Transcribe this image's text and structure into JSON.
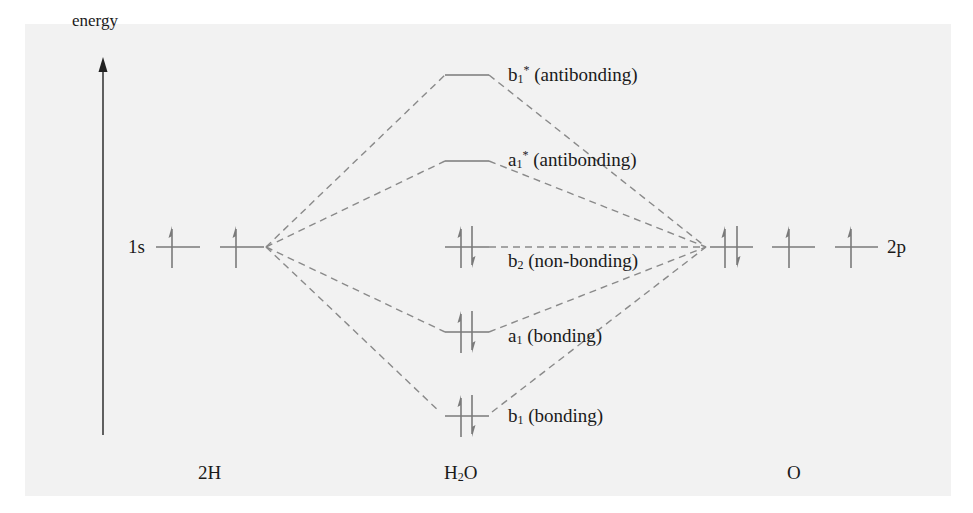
{
  "diagram": {
    "type": "molecular-orbital-diagram",
    "axis": {
      "label": "energy",
      "direction": "up"
    },
    "colors": {
      "background_panel": "#f2f2f2",
      "level_line": "#7a7a7a",
      "connector": "#8a8a8a",
      "text": "#1a1a1a",
      "axis": "#222222"
    },
    "columns": {
      "left": {
        "label": "2H",
        "orbital_label": "1s"
      },
      "middle": {
        "label_main": "H",
        "label_sub": "2",
        "label_tail": "O"
      },
      "right": {
        "label": "O",
        "orbital_label": "2p"
      }
    },
    "left_levels": [
      {
        "id": "H-1s-a",
        "electrons": "up"
      },
      {
        "id": "H-1s-b",
        "electrons": "up"
      }
    ],
    "right_levels": [
      {
        "id": "O-2p-a",
        "electrons": "up-down"
      },
      {
        "id": "O-2p-b",
        "electrons": "up"
      },
      {
        "id": "O-2p-c",
        "electrons": "up"
      }
    ],
    "mo_levels": [
      {
        "id": "b1-star",
        "sym": "b",
        "sub": "1",
        "sup": "*",
        "desc": "(antibonding)",
        "electrons": "empty"
      },
      {
        "id": "a1-star",
        "sym": "a",
        "sub": "1",
        "sup": "*",
        "desc": "(antibonding)",
        "electrons": "empty"
      },
      {
        "id": "b2",
        "sym": "b",
        "sub": "2",
        "sup": "",
        "desc": "(non-bonding)",
        "electrons": "up-down"
      },
      {
        "id": "a1",
        "sym": "a",
        "sub": "1",
        "sup": "",
        "desc": "(bonding)",
        "electrons": "up-down"
      },
      {
        "id": "b1",
        "sym": "b",
        "sub": "1",
        "sup": "",
        "desc": "(bonding)",
        "electrons": "up-down"
      }
    ],
    "connections": [
      "2H -> b1*",
      "2H -> a1*",
      "2H -> a1",
      "2H -> b1",
      "O -> b1*",
      "O -> a1*",
      "O -> b2",
      "O -> a1",
      "O -> b1"
    ]
  }
}
